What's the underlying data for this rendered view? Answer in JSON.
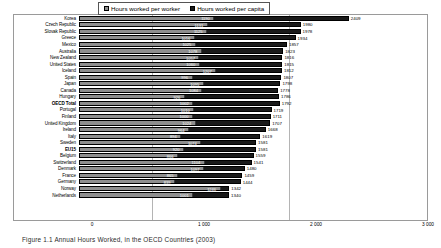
{
  "caption": "Figure 1.1  Annual Hours Worked, in the OECD Countries (2003)",
  "legend": [
    {
      "label": "Hours worked per worker",
      "color": "#8e8e8e",
      "icon": "square-swatch"
    },
    {
      "label": "Hours worked per capita",
      "color": "#1a1a1a",
      "icon": "square-swatch"
    }
  ],
  "axis": {
    "ticks": [
      "0",
      "1 000",
      "2 000",
      "3 000"
    ],
    "min": 0,
    "max": 3000
  },
  "chart_data": {
    "type": "bar",
    "orientation": "horizontal",
    "title": "Figure 1.1  Annual Hours Worked, in the OECD Countries (2003)",
    "xlabel": "",
    "ylabel": "",
    "xlim": [
      0,
      3000
    ],
    "grid": true,
    "legend_position": "top",
    "categories": [
      "Korea",
      "Czech Republic",
      "Slovak Republic",
      "Greece",
      "Mexico",
      "Australia",
      "New Zealand",
      "United States",
      "Iceland",
      "Spain",
      "Japan",
      "Canada",
      "Hungary",
      "OECD Total",
      "Portugal",
      "Finland",
      "United Kingdom",
      "Ireland",
      "Italy",
      "Sweden",
      "EU15",
      "Belgium",
      "Switzerland",
      "Denmark",
      "France",
      "Germany",
      "Norway",
      "Netherlands"
    ],
    "series": [
      {
        "name": "Hours worked per worker",
        "color": "#1a1a1a",
        "values": [
          2409,
          1980,
          1978,
          1934,
          1857,
          1823,
          1816,
          1815,
          1812,
          1807,
          1798,
          1778,
          1786,
          1792,
          1719,
          1711,
          1707,
          1668,
          1619,
          1581,
          1581,
          1559,
          1541,
          1480,
          1459,
          1444,
          1342,
          1340
        ]
      },
      {
        "name": "Hours worked per capita",
        "color": "#8e8e8e",
        "values": [
          1190,
          1131,
          1125,
          1016,
          1025,
          1078,
          1057,
          1060,
          1207,
          996,
          1095,
          1084,
          926,
          1002,
          1010,
          1000,
          1024,
          964,
          894,
          1074,
          920,
          866,
          1104,
          1097,
          865,
          839,
          1246,
          1001
        ]
      }
    ]
  },
  "rows": [
    {
      "label": "Korea",
      "outer": 2409,
      "inner": 1190,
      "bold": false
    },
    {
      "label": "Czech Republic",
      "outer": 1980,
      "inner": 1131,
      "bold": false
    },
    {
      "label": "Slovak Republic",
      "outer": 1978,
      "inner": 1125,
      "bold": false
    },
    {
      "label": "Greece",
      "outer": 1934,
      "inner": 1016,
      "bold": false
    },
    {
      "label": "Mexico",
      "outer": 1857,
      "inner": 1025,
      "bold": false
    },
    {
      "label": "Australia",
      "outer": 1823,
      "inner": 1078,
      "bold": false
    },
    {
      "label": "New Zealand",
      "outer": 1816,
      "inner": 1057,
      "bold": false
    },
    {
      "label": "United States",
      "outer": 1815,
      "inner": 1060,
      "bold": false
    },
    {
      "label": "Iceland",
      "outer": 1812,
      "inner": 1207,
      "bold": false
    },
    {
      "label": "Spain",
      "outer": 1807,
      "inner": 996,
      "bold": false
    },
    {
      "label": "Japan",
      "outer": 1798,
      "inner": 1095,
      "bold": false
    },
    {
      "label": "Canada",
      "outer": 1778,
      "inner": 1084,
      "bold": false
    },
    {
      "label": "Hungary",
      "outer": 1786,
      "inner": 926,
      "bold": false
    },
    {
      "label": "OECD Total",
      "outer": 1792,
      "inner": 1002,
      "bold": true
    },
    {
      "label": "Portugal",
      "outer": 1719,
      "inner": 1010,
      "bold": false
    },
    {
      "label": "Finland",
      "outer": 1711,
      "inner": 1000,
      "bold": false
    },
    {
      "label": "United Kingdom",
      "outer": 1707,
      "inner": 1024,
      "bold": false
    },
    {
      "label": "Ireland",
      "outer": 1668,
      "inner": 964,
      "bold": false
    },
    {
      "label": "Italy",
      "outer": 1619,
      "inner": 894,
      "bold": false
    },
    {
      "label": "Sweden",
      "outer": 1581,
      "inner": 1074,
      "bold": false
    },
    {
      "label": "EU15",
      "outer": 1581,
      "inner": 920,
      "bold": true
    },
    {
      "label": "Belgium",
      "outer": 1559,
      "inner": 866,
      "bold": false
    },
    {
      "label": "Switzerland",
      "outer": 1541,
      "inner": 1104,
      "bold": false
    },
    {
      "label": "Denmark",
      "outer": 1480,
      "inner": 1097,
      "bold": false
    },
    {
      "label": "France",
      "outer": 1459,
      "inner": 865,
      "bold": false
    },
    {
      "label": "Germany",
      "outer": 1444,
      "inner": 839,
      "bold": false
    },
    {
      "label": "Norway",
      "outer": 1342,
      "inner": 1246,
      "bold": false
    },
    {
      "label": "Netherlands",
      "outer": 1340,
      "inner": 1001,
      "bold": false
    }
  ]
}
